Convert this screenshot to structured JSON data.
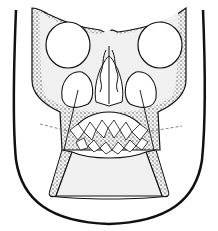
{
  "figure": {
    "colors": {
      "line": "#111111",
      "fill": "#f0f0f0",
      "stipple": "#555555",
      "background": "#ffffff"
    }
  }
}
